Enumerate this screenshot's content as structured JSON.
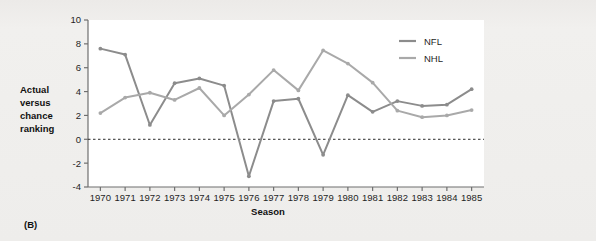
{
  "panel_label": "(B)",
  "axis": {
    "ylabel_lines": [
      "Actual",
      "versus",
      "chance",
      "ranking"
    ],
    "xlabel": "Season",
    "yticks": [
      "10",
      "8",
      "6",
      "4",
      "2",
      "0",
      "-2",
      "-4"
    ]
  },
  "legend": {
    "position": "top-right",
    "entries": [
      {
        "label": "NFL",
        "color": "#8c8c8c"
      },
      {
        "label": "NHL",
        "color": "#a9a9a9"
      }
    ]
  },
  "colors": {
    "nfl": "#8c8c8c",
    "nhl": "#a9a9a9",
    "axis": "#6f6f6f",
    "zero_line": "#2b2b2b",
    "plot_background": "#ffffff",
    "page_background": "#eeedeb"
  },
  "chart_data": {
    "type": "line",
    "title": "",
    "xlabel": "Season",
    "ylabel": "Actual versus chance ranking",
    "categories": [
      "1970",
      "1971",
      "1972",
      "1973",
      "1974",
      "1975",
      "1976",
      "1977",
      "1978",
      "1979",
      "1980",
      "1981",
      "1982",
      "1983",
      "1984",
      "1985"
    ],
    "x": [
      1970,
      1971,
      1972,
      1973,
      1974,
      1975,
      1976,
      1977,
      1978,
      1979,
      1980,
      1981,
      1982,
      1983,
      1984,
      1985
    ],
    "series": [
      {
        "name": "NFL",
        "color": "#8c8c8c",
        "values": [
          7.6,
          7.1,
          1.2,
          4.7,
          5.1,
          4.5,
          -3.1,
          3.2,
          3.4,
          -1.3,
          3.7,
          2.3,
          3.2,
          2.8,
          2.9,
          4.2
        ]
      },
      {
        "name": "NHL",
        "color": "#a9a9a9",
        "values": [
          2.2,
          3.5,
          3.9,
          3.3,
          4.3,
          2.0,
          3.75,
          5.8,
          4.1,
          7.45,
          6.35,
          4.75,
          2.4,
          1.85,
          2.0,
          2.45
        ]
      }
    ],
    "ylim": [
      -4,
      10
    ],
    "ytick_values": [
      10,
      8,
      6,
      4,
      2,
      0,
      -2,
      -4
    ],
    "grid": false,
    "reference_line": {
      "value": 0,
      "style": "dashed"
    },
    "legend_position": "top-right"
  }
}
